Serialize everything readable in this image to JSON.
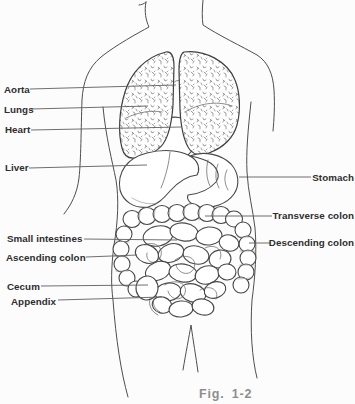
{
  "figure": {
    "caption": "Fig. 1-2"
  },
  "colors": {
    "background": "#fcfcfc",
    "line_art": "#4e4e4e",
    "label_text": "#2e2e2e",
    "caption_text": "#8e8e8e"
  },
  "labels": {
    "aorta": "Aorta",
    "lungs": "Lungs",
    "heart": "Heart",
    "liver": "Liver",
    "stomach": "Stomach",
    "transverse_colon": "Transverse colon",
    "descending_colon": "Descending colon",
    "small_intestines": "Small intestines",
    "ascending_colon": "Ascending colon",
    "cecum": "Cecum",
    "appendix": "Appendix"
  }
}
